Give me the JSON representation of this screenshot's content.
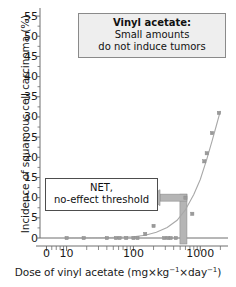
{
  "chart_data": {
    "type": "scatter",
    "xlabel": "Dose of vinyl acetate (mg×kg⁻¹×day⁻¹)",
    "ylabel": "Incidence of squamous cell carcinoma (%)",
    "xscale": "log",
    "xlim": [
      4,
      2600
    ],
    "ylim": [
      0,
      57
    ],
    "grid": false,
    "legend": null,
    "x_ticks": [
      {
        "value": 5,
        "label": "0"
      },
      {
        "value": 10,
        "label": "10"
      },
      {
        "value": 100,
        "label": "100"
      },
      {
        "value": 1000,
        "label": "1000"
      }
    ],
    "y_ticks": [
      0,
      5,
      10,
      15,
      20,
      25,
      30,
      35,
      40,
      45,
      50,
      55
    ],
    "y_tick_labels": [
      "0",
      "5",
      "10",
      "15",
      "20",
      "25",
      "30",
      "35",
      "40",
      "45",
      "50",
      "55"
    ],
    "points": [
      {
        "x": 10,
        "y": 0
      },
      {
        "x": 18,
        "y": 0
      },
      {
        "x": 40,
        "y": 0
      },
      {
        "x": 55,
        "y": 0
      },
      {
        "x": 62,
        "y": 0
      },
      {
        "x": 78,
        "y": 0
      },
      {
        "x": 100,
        "y": 0
      },
      {
        "x": 115,
        "y": 0
      },
      {
        "x": 150,
        "y": 1
      },
      {
        "x": 200,
        "y": 3
      },
      {
        "x": 290,
        "y": 0
      },
      {
        "x": 330,
        "y": 0
      },
      {
        "x": 360,
        "y": 0
      },
      {
        "x": 430,
        "y": 0
      },
      {
        "x": 600,
        "y": 10
      },
      {
        "x": 760,
        "y": 6
      },
      {
        "x": 1150,
        "y": 19
      },
      {
        "x": 1250,
        "y": 21
      },
      {
        "x": 1500,
        "y": 26
      },
      {
        "x": 1900,
        "y": 31
      }
    ],
    "fit_curve": {
      "name": "dose-response curve",
      "points": [
        {
          "x": 10,
          "y": 0.0
        },
        {
          "x": 30,
          "y": 0.05
        },
        {
          "x": 60,
          "y": 0.15
        },
        {
          "x": 100,
          "y": 0.3
        },
        {
          "x": 150,
          "y": 0.7
        },
        {
          "x": 220,
          "y": 1.4
        },
        {
          "x": 320,
          "y": 2.6
        },
        {
          "x": 450,
          "y": 4.4
        },
        {
          "x": 600,
          "y": 7.0
        },
        {
          "x": 800,
          "y": 10.8
        },
        {
          "x": 1000,
          "y": 14.5
        },
        {
          "x": 1250,
          "y": 19.5
        },
        {
          "x": 1500,
          "y": 24.0
        },
        {
          "x": 1750,
          "y": 28.0
        },
        {
          "x": 2000,
          "y": 31.5
        }
      ]
    },
    "annotations": [
      {
        "name": "title-callout",
        "lines": [
          "Vinyl acetate:",
          "Small amounts",
          "do not induce tumors"
        ],
        "bold_first": true
      },
      {
        "name": "net-callout",
        "lines": [
          "NET,",
          "no-effect threshold"
        ],
        "bold_first": false
      }
    ],
    "threshold_marker": {
      "label": "NET, no-effect threshold",
      "x_value": 560,
      "y_value": 10,
      "color": "#b5b5b5"
    }
  },
  "colors": {
    "axis": "#6e6e6e",
    "point": "#9a9a9a",
    "curve": "#a8a8a8",
    "threshold": "#b5b5b5",
    "callout_fill": "#eeeeee",
    "callout_border": "#8a8a8a",
    "text": "#1a1a1a"
  },
  "axis_title": {
    "x_prefix": "Dose of vinyl acetate (mg×kg",
    "x_sup1": "−1",
    "x_mid": "×day",
    "x_sup2": "−1",
    "x_suffix": ")",
    "y": "Incidence of squamous cell carcinoma (%)"
  }
}
